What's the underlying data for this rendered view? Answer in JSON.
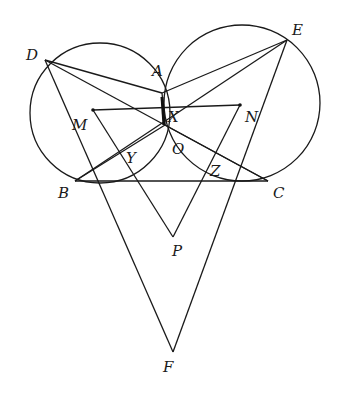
{
  "figure": {
    "points": {
      "D": {
        "label": "D",
        "x": 45,
        "y": 60,
        "lx": 26,
        "ly": 60
      },
      "E": {
        "label": "E",
        "x": 287,
        "y": 40,
        "lx": 292,
        "ly": 35
      },
      "A": {
        "label": "A",
        "x": 162,
        "y": 93,
        "lx": 152,
        "ly": 76
      },
      "X": {
        "label": "X",
        "x": 165,
        "y": 125,
        "lx": 168,
        "ly": 122
      },
      "O": {
        "label": "O",
        "x": 175,
        "y": 138,
        "lx": 172,
        "ly": 154
      },
      "M": {
        "label": "M",
        "x": 93,
        "y": 110,
        "lx": 72,
        "ly": 130
      },
      "N": {
        "label": "N",
        "x": 240,
        "y": 105,
        "lx": 245,
        "ly": 122
      },
      "Y": {
        "label": "Y",
        "x": 120,
        "y": 155,
        "lx": 126,
        "ly": 163
      },
      "Z": {
        "label": "Z",
        "x": 205,
        "y": 168,
        "lx": 210,
        "ly": 176
      },
      "B": {
        "label": "B",
        "x": 75,
        "y": 181,
        "lx": 58,
        "ly": 198
      },
      "C": {
        "label": "C",
        "x": 268,
        "y": 181,
        "lx": 273,
        "ly": 198
      },
      "P": {
        "label": "P",
        "x": 173,
        "y": 237,
        "lx": 172,
        "ly": 256
      },
      "F": {
        "label": "F",
        "x": 173,
        "y": 352,
        "lx": 163,
        "ly": 372
      }
    },
    "circles": [
      {
        "name": "left-circle",
        "cx": 100,
        "cy": 113,
        "r": 70
      },
      {
        "name": "right-circle",
        "cx": 242,
        "cy": 103,
        "r": 78
      }
    ],
    "segments": [
      [
        "D",
        "A"
      ],
      [
        "A",
        "E"
      ],
      [
        "D",
        "F"
      ],
      [
        "E",
        "F"
      ],
      [
        "B",
        "C"
      ],
      [
        "M",
        "N"
      ],
      [
        "M",
        "P"
      ],
      [
        "N",
        "P"
      ],
      [
        "D",
        "C"
      ],
      [
        "E",
        "B"
      ],
      [
        "B",
        "X"
      ],
      [
        "C",
        "X"
      ],
      [
        "A",
        "X"
      ]
    ]
  }
}
